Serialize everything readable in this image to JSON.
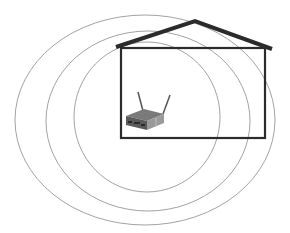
{
  "diagram": {
    "title": "Wireless router signal coverage of a house",
    "nodes": [
      {
        "id": "house",
        "label": "House"
      },
      {
        "id": "router",
        "label": "Wireless router",
        "icon": "router-icon"
      },
      {
        "id": "signal",
        "label": "Signal range rings",
        "count": 3
      }
    ],
    "colors": {
      "background": "#ffffff",
      "house_stroke": "#2b2b2b",
      "signal_rings": "#8a8a8a",
      "router_body": "#6e6e6e"
    }
  }
}
